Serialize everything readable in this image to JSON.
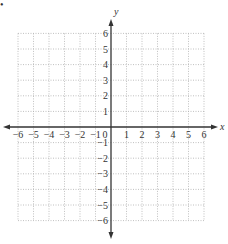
{
  "figure": {
    "marker": "•",
    "x_axis_label": "x",
    "y_axis_label": "y",
    "origin_label": "0"
  },
  "chart_data": {
    "type": "coordinate-grid",
    "title": "",
    "xlabel": "x",
    "ylabel": "y",
    "xlim": [
      -6,
      6
    ],
    "ylim": [
      -6,
      6
    ],
    "grid": true,
    "grid_style": "dotted",
    "x_ticks": [
      -6,
      -5,
      -4,
      -3,
      -2,
      -1,
      1,
      2,
      3,
      4,
      5,
      6
    ],
    "y_ticks": [
      -6,
      -5,
      -4,
      -3,
      -2,
      -1,
      1,
      2,
      3,
      4,
      5,
      6
    ],
    "x_tick_labels": [
      "−6",
      "−5",
      "−4",
      "−3",
      "−2",
      "−1",
      "1",
      "2",
      "3",
      "4",
      "5",
      "6"
    ],
    "y_tick_labels": [
      "−6",
      "−5",
      "−4",
      "−3",
      "−2",
      "−1",
      "1",
      "2",
      "3",
      "4",
      "5",
      "6"
    ],
    "points": [],
    "series": []
  },
  "colors": {
    "axis": "#333333",
    "grid": "#b0b0b0",
    "text": "#333333"
  }
}
